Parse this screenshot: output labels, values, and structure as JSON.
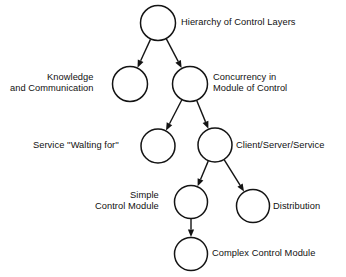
{
  "diagram": {
    "type": "tree-hierarchy",
    "title": "",
    "background_color": "#ffffff",
    "line_color": "#141414",
    "text_color": "#111111",
    "nodes": [
      {
        "id": "hierarchy",
        "label": "Hierarchy of Control Layers",
        "label_lines": [
          "Hierarchy of Control Layers"
        ],
        "label_side": "right",
        "cx": 158,
        "cy": 23,
        "r": 17.5,
        "label_x": 181,
        "label_y": 17
      },
      {
        "id": "knowledge",
        "label": "Knowledge and Communication",
        "label_lines": [
          "Knowledge",
          "and Communication"
        ],
        "label_side": "left",
        "cx": 130,
        "cy": 84,
        "r": 17.5,
        "label_x": 10,
        "label_y": 72
      },
      {
        "id": "concurrency",
        "label": "Concurrency in Module of Control",
        "label_lines": [
          "Concurrency in",
          "Module of Control"
        ],
        "label_side": "right",
        "cx": 190,
        "cy": 84,
        "r": 17.5,
        "label_x": 213,
        "label_y": 72
      },
      {
        "id": "service",
        "label": "Service ''Walting for''",
        "label_lines": [
          "Service ''Walting for''"
        ],
        "label_side": "left",
        "cx": 158,
        "cy": 146,
        "r": 17,
        "label_x": 33,
        "label_y": 140
      },
      {
        "id": "client-server",
        "label": "Client/Server/Service",
        "label_lines": [
          "Client/Server/Service"
        ],
        "label_side": "right",
        "cx": 215,
        "cy": 145,
        "r": 17,
        "label_x": 236,
        "label_y": 140
      },
      {
        "id": "simple-control-module",
        "label": "Simple Control Module",
        "label_lines": [
          "Simple",
          "Control Module"
        ],
        "label_side": "left",
        "cx": 191,
        "cy": 202,
        "r": 16.5,
        "label_x": 95,
        "label_y": 190
      },
      {
        "id": "distribution",
        "label": "Distribution",
        "label_lines": [
          "Distribution"
        ],
        "label_side": "right",
        "cx": 253,
        "cy": 206,
        "r": 16.5,
        "label_x": 273,
        "label_y": 201
      },
      {
        "id": "complex-control-module",
        "label": "Complex Control Module",
        "label_lines": [
          "Complex Control Module"
        ],
        "label_side": "right",
        "cx": 191,
        "cy": 254,
        "r": 16.5,
        "label_x": 212,
        "label_y": 248
      }
    ],
    "edges": [
      {
        "id": "hierarchy-to-knowledge",
        "from": "hierarchy",
        "to": "knowledge",
        "arrow": true
      },
      {
        "id": "hierarchy-to-concurrency",
        "from": "hierarchy",
        "to": "concurrency",
        "arrow": true
      },
      {
        "id": "concurrency-to-service",
        "from": "concurrency",
        "to": "service",
        "arrow": true
      },
      {
        "id": "concurrency-to-client-server",
        "from": "concurrency",
        "to": "client-server",
        "arrow": true
      },
      {
        "id": "client-server-to-simple",
        "from": "client-server",
        "to": "simple-control-module",
        "arrow": true
      },
      {
        "id": "client-server-to-distribution",
        "from": "client-server",
        "to": "distribution",
        "arrow": true
      },
      {
        "id": "simple-to-complex",
        "from": "simple-control-module",
        "to": "complex-control-module",
        "arrow": true
      }
    ]
  }
}
